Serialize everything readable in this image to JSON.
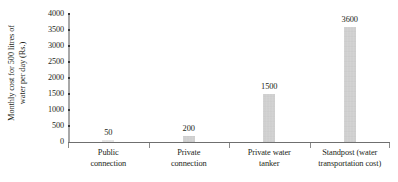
{
  "chart_data": {
    "type": "bar",
    "title": "",
    "xlabel": "",
    "ylabel_line1": "Monthly cost for 500 litres of",
    "ylabel_line2": "water per day (Rs.)",
    "categories": [
      "Public connection",
      "Private connection",
      "Private water tanker",
      "Standpost (water transportation cost)"
    ],
    "category_lines": [
      [
        "Public",
        "connection"
      ],
      [
        "Private",
        "connection"
      ],
      [
        "Private water",
        "tanker"
      ],
      [
        "Standpost (water",
        "transportation cost)"
      ]
    ],
    "values": [
      50,
      200,
      1500,
      3600
    ],
    "value_labels": [
      "50",
      "200",
      "1500",
      "3600"
    ],
    "ylim": [
      0,
      4000
    ],
    "yticks": [
      0,
      500,
      1000,
      1500,
      2000,
      2500,
      3000,
      3500,
      4000
    ],
    "ytick_labels": [
      "0",
      "500",
      "1000",
      "1500",
      "2000",
      "2500",
      "3000",
      "3500",
      "4000"
    ],
    "grid": false,
    "legend": null,
    "bar_color": "#cdcdcd",
    "axis_color": "#6f6f6f",
    "spine_color": "#a8a8a8",
    "text_color": "#231f20"
  }
}
